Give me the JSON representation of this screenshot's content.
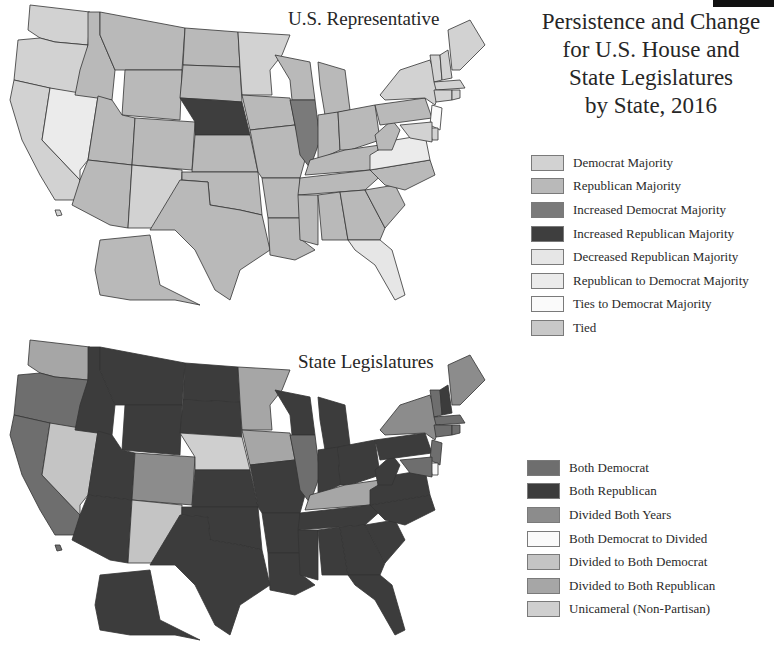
{
  "title": {
    "lines": [
      "Persistence and Change",
      "for U.S. House and",
      "State Legislatures",
      "by State, 2016"
    ]
  },
  "maps": [
    {
      "id": "house",
      "label": "U.S. Representative",
      "legend": [
        {
          "key": "DM",
          "label": "Democrat Majority",
          "color": "#d2d2d2"
        },
        {
          "key": "RM",
          "label": "Republican Majority",
          "color": "#b9b9b9"
        },
        {
          "key": "IDM",
          "label": "Increased Democrat Majority",
          "color": "#7a7a7a"
        },
        {
          "key": "IRM",
          "label": "Increased Republican Majority",
          "color": "#3e3e3e"
        },
        {
          "key": "DRM",
          "label": "Decreased Republican Majority",
          "color": "#e6e6e6"
        },
        {
          "key": "RDM",
          "label": "Republican to Democrat Majority",
          "color": "#ebebeb"
        },
        {
          "key": "TDM",
          "label": "Ties to Democrat Majority",
          "color": "#fafafa"
        },
        {
          "key": "T",
          "label": "Tied",
          "color": "#c8c8c8"
        }
      ],
      "states": {
        "WA": "DM",
        "OR": "DM",
        "CA": "DM",
        "NV": "RDM",
        "ID": "RM",
        "MT": "RM",
        "WY": "RM",
        "UT": "RM",
        "AZ": "RM",
        "CO": "RM",
        "NM": "DM",
        "ND": "RM",
        "SD": "RM",
        "NE": "IRM",
        "KS": "RM",
        "OK": "RM",
        "TX": "RM",
        "MN": "DM",
        "IA": "RM",
        "MO": "RM",
        "AR": "RM",
        "LA": "RM",
        "WI": "RM",
        "IL": "IDM",
        "MI": "RM",
        "IN": "RM",
        "OH": "RM",
        "KY": "RM",
        "TN": "RM",
        "MS": "RM",
        "AL": "RM",
        "GA": "RM",
        "FL": "DRM",
        "SC": "RM",
        "NC": "RM",
        "VA": "RDM",
        "WV": "RM",
        "PA": "RM",
        "NY": "DM",
        "VT": "DM",
        "NH": "DM",
        "ME": "DM",
        "MA": "DM",
        "CT": "DM",
        "RI": "DM",
        "NJ": "TDM",
        "DE": "DM",
        "MD": "DM",
        "AK": "RM",
        "HI": "DM"
      }
    },
    {
      "id": "legislature",
      "label": "State Legislatures",
      "legend": [
        {
          "key": "BD",
          "label": "Both Democrat",
          "color": "#6e6e6e"
        },
        {
          "key": "BR",
          "label": "Both Republican",
          "color": "#3c3c3c"
        },
        {
          "key": "DBY",
          "label": "Divided Both Years",
          "color": "#8c8c8c"
        },
        {
          "key": "BDD",
          "label": "Both Democrat to Divided",
          "color": "#fafafa"
        },
        {
          "key": "DBD",
          "label": "Divided to Both Democrat",
          "color": "#c4c4c4"
        },
        {
          "key": "DBR",
          "label": "Divided to Both Republican",
          "color": "#a6a6a6"
        },
        {
          "key": "UNI",
          "label": "Unicameral (Non-Partisan)",
          "color": "#cfcfcf"
        }
      ],
      "states": {
        "WA": "DBR",
        "OR": "BD",
        "CA": "BD",
        "NV": "DBD",
        "ID": "BR",
        "MT": "BR",
        "WY": "BR",
        "UT": "BR",
        "AZ": "BR",
        "CO": "DBY",
        "NM": "DBD",
        "ND": "BR",
        "SD": "BR",
        "NE": "UNI",
        "KS": "BR",
        "OK": "BR",
        "TX": "BR",
        "MN": "DBR",
        "IA": "DBR",
        "MO": "BR",
        "AR": "BR",
        "LA": "BR",
        "WI": "BR",
        "IL": "BD",
        "MI": "BR",
        "IN": "BR",
        "OH": "BR",
        "KY": "DBR",
        "TN": "BR",
        "MS": "BR",
        "AL": "BR",
        "GA": "BR",
        "FL": "BR",
        "SC": "BR",
        "NC": "BR",
        "VA": "BR",
        "WV": "BR",
        "PA": "BR",
        "NY": "DBY",
        "VT": "BD",
        "NH": "BR",
        "ME": "DBY",
        "MA": "BD",
        "CT": "BD",
        "RI": "BD",
        "NJ": "BD",
        "DE": "BDD",
        "MD": "BD",
        "AK": "BR",
        "HI": "BD"
      }
    }
  ]
}
